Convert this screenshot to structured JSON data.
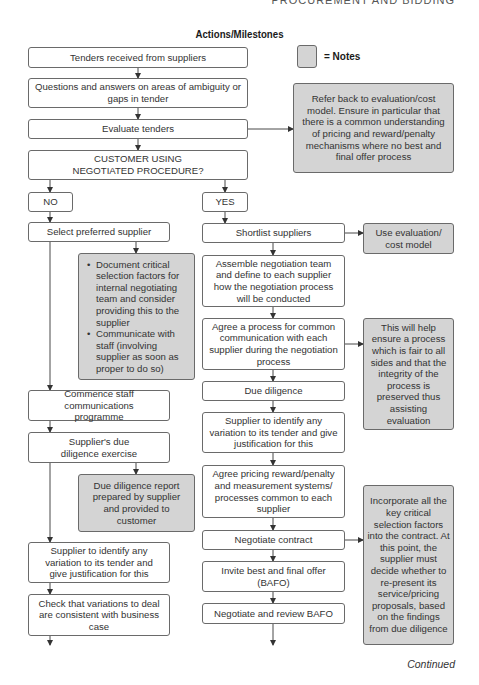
{
  "running_head": "PROCUREMENT AND BIDDING",
  "title": "Actions/Milestones",
  "legend": {
    "label": "= Notes",
    "note_color": "#d4d4d4"
  },
  "main_flow": {
    "tenders_received": "Tenders received from suppliers",
    "questions_answers": "Questions and answers on areas of ambiguity or gaps in tender",
    "evaluate_tenders": "Evaluate tenders",
    "decision": "CUSTOMER USING NEGOTIATED PROCEDURE?",
    "no": "NO",
    "yes": "YES"
  },
  "no_branch": {
    "select_preferred": "Select preferred supplier",
    "commence_staff": "Commence staff communications programme",
    "supplier_due_diligence": "Supplier's due diligence exercise",
    "supplier_identify_variation": "Supplier to identify any variation to its tender and give justification for this",
    "check_variations": "Check that variations to deal are consistent with business case"
  },
  "yes_branch": {
    "shortlist": "Shortlist suppliers",
    "assemble_team": "Assemble negotiation team and define to each supplier how the negotiation process will be conducted",
    "agree_process": "Agree a process for common communication with each supplier during the negotiation process",
    "due_diligence": "Due diligence",
    "supplier_identify_variation": "Supplier to identify any variation to its tender and give justification for this",
    "agree_pricing": "Agree pricing reward/penalty and measurement systems/ processes common to each supplier",
    "negotiate_contract": "Negotiate contract",
    "invite_bafo": "Invite best and final offer (BAFO)",
    "negotiate_review_bafo": "Negotiate and review BAFO"
  },
  "notes": {
    "refer_back": "Refer back to evaluation/cost model. Ensure in particular that there is a common understanding of pricing and reward/penalty mechanisms where no best and final offer process",
    "use_evaluation": "Use evaluation/ cost model",
    "selection_bullets": [
      "Document critical selection factors for internal negotiating team and consider providing this to the supplier",
      "Communicate with staff (involving supplier as soon as proper to do so)"
    ],
    "fair_process": "This will help ensure a process which is fair to all sides and that the integrity of the process is preserved thus assisting evaluation",
    "due_diligence_report": "Due diligence report prepared by supplier and provided to customer",
    "incorporate_factors": "Incorporate all the key critical selection factors into the contract. At this point, the supplier must decide whether to re-present its service/pricing proposals, based on the findings from due diligence"
  },
  "footer": {
    "continued": "Continued"
  }
}
